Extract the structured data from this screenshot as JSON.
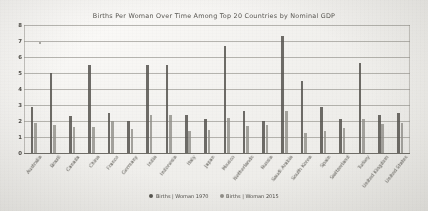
{
  "chart_data": {
    "type": "bar",
    "title": "Births Per Woman Over Time Among Top 20 Countries by Nominal GDP",
    "xlabel": "",
    "ylabel": "",
    "ylim": [
      0,
      8
    ],
    "yticks": [
      "0",
      "1",
      "2",
      "3",
      "4",
      "5",
      "6",
      "7",
      "8"
    ],
    "grid": true,
    "legend_position": "bottom",
    "categories": [
      "Australia",
      "Brazil",
      "Canada",
      "China",
      "France",
      "Germany",
      "India",
      "Indonesia",
      "Italy",
      "Japan",
      "Mexico",
      "Netherlands",
      "Russia",
      "Saudi Arabia",
      "South Korea",
      "Spain",
      "Switzerland",
      "Turkey",
      "United Kingdom",
      "United States"
    ],
    "series": [
      {
        "name": "Births | Woman 1970",
        "color": "#56544f",
        "values": [
          2.9,
          5.0,
          2.3,
          5.5,
          2.5,
          2.0,
          5.5,
          5.5,
          2.4,
          2.1,
          6.7,
          2.6,
          2.0,
          7.3,
          4.5,
          2.9,
          2.1,
          5.6,
          2.4,
          2.5
        ]
      },
      {
        "name": "Births | Woman 2015",
        "color": "#908e88",
        "values": [
          1.85,
          1.75,
          1.6,
          1.6,
          2.0,
          1.5,
          2.4,
          2.4,
          1.4,
          1.45,
          2.2,
          1.7,
          1.75,
          2.6,
          1.25,
          1.35,
          1.55,
          2.1,
          1.8,
          1.85
        ]
      }
    ]
  },
  "legend": {
    "items": [
      {
        "label": "Births | Woman 1970"
      },
      {
        "label": "Births | Woman 2015"
      }
    ]
  }
}
